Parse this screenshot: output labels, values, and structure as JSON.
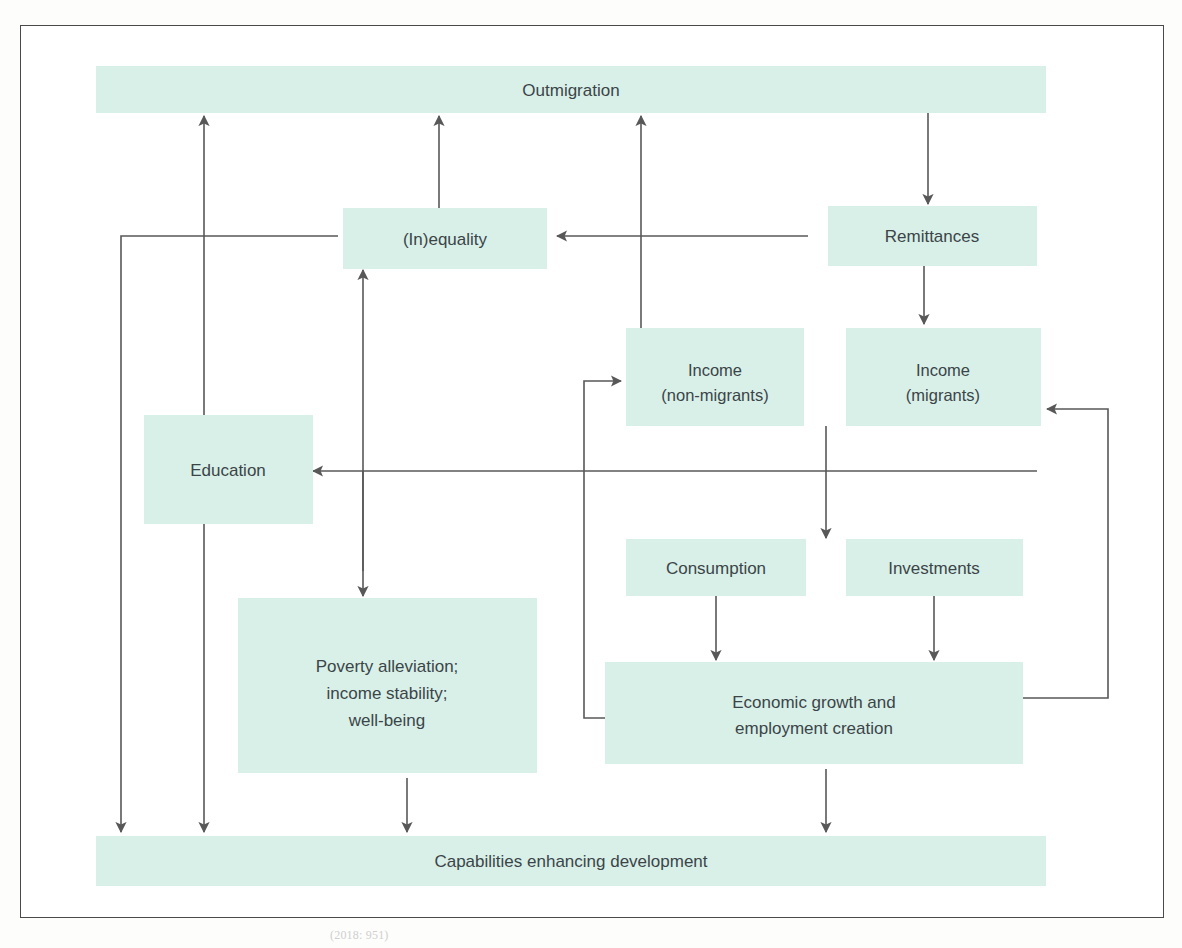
{
  "figure": {
    "title_visible": false,
    "caption_partial": "(2018: 951)",
    "box_fill": "#d9f0e8",
    "line_color": "#585858",
    "text_color": "#3b4548",
    "frame_color": "#4a4a4a"
  },
  "nodes": {
    "outmigration": {
      "label": "Outmigration"
    },
    "inequality": {
      "label": "(In)equality"
    },
    "remittances": {
      "label": "Remittances"
    },
    "income_non_migrants": {
      "label_line1": "Income",
      "label_line2": "(non-migrants)"
    },
    "income_migrants": {
      "label_line1": "Income",
      "label_line2": "(migrants)"
    },
    "education": {
      "label": "Education"
    },
    "consumption": {
      "label": "Consumption"
    },
    "investments": {
      "label": "Investments"
    },
    "poverty": {
      "label_line1": "Poverty alleviation;",
      "label_line2": "income stability;",
      "label_line3": "well-being"
    },
    "economic_growth": {
      "label_line1": "Economic growth and",
      "label_line2": "employment creation"
    },
    "capabilities": {
      "label": "Capabilities enhancing development"
    }
  },
  "edges": [
    {
      "id": "outmigration-to-remittances",
      "from": "outmigration",
      "to": "remittances",
      "direction": "down"
    },
    {
      "id": "remittances-to-inequality",
      "from": "remittances",
      "to": "inequality",
      "direction": "left"
    },
    {
      "id": "remittances-to-income-migrants",
      "from": "remittances",
      "to": "income_migrants",
      "direction": "down"
    },
    {
      "id": "income-non-migrants-to-outmigration",
      "from": "income_non_migrants",
      "to": "outmigration",
      "direction": "up"
    },
    {
      "id": "inequality-to-outmigration",
      "from": "inequality",
      "to": "outmigration",
      "direction": "up"
    },
    {
      "id": "inequality-to-capabilities",
      "from": "inequality",
      "to": "capabilities",
      "direction": "down-left"
    },
    {
      "id": "education-outmigration-capabilities",
      "from": "education",
      "to": "outmigration",
      "direction": "bidirectional-vertical"
    },
    {
      "id": "income-to-education",
      "from": "income_non_migrants",
      "to": "education",
      "direction": "left"
    },
    {
      "id": "income-to-inequality",
      "from": "income_non_migrants",
      "to": "inequality",
      "direction": "up"
    },
    {
      "id": "income-to-poverty",
      "from": "income_non_migrants",
      "to": "poverty",
      "direction": "down"
    },
    {
      "id": "income-to-consumption-investments",
      "from": "income_non_migrants",
      "to": "consumption",
      "direction": "down"
    },
    {
      "id": "consumption-to-economic-growth",
      "from": "consumption",
      "to": "economic_growth",
      "direction": "down"
    },
    {
      "id": "investments-to-economic-growth",
      "from": "investments",
      "to": "economic_growth",
      "direction": "down"
    },
    {
      "id": "economic-growth-to-income-non-migrants",
      "from": "economic_growth",
      "to": "income_non_migrants",
      "direction": "left-up"
    },
    {
      "id": "economic-growth-to-income-migrants",
      "from": "economic_growth",
      "to": "income_migrants",
      "direction": "right-up"
    },
    {
      "id": "economic-growth-to-capabilities",
      "from": "economic_growth",
      "to": "capabilities",
      "direction": "down"
    },
    {
      "id": "poverty-to-capabilities",
      "from": "poverty",
      "to": "capabilities",
      "direction": "down"
    }
  ]
}
